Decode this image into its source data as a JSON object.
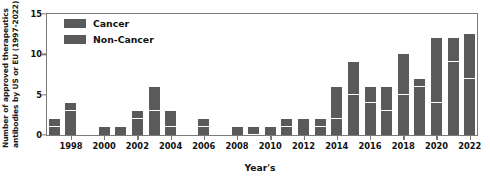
{
  "chart_data": {
    "type": "bar",
    "subtype": "stacked-bar",
    "title": "",
    "xlabel": "Year's",
    "ylabel": "Number of approved therapeutics antibodies by US or EU (1997-2022)",
    "ylabel_lines": [
      "Number of approved therapeutics",
      "antibodies by US or EU (1997-2022)"
    ],
    "ylim": [
      0,
      15
    ],
    "yticks": [
      0,
      5,
      10,
      15
    ],
    "ytick_labels": [
      "0",
      "5",
      "10",
      "15"
    ],
    "xlim": [
      1996.5,
      2022.5
    ],
    "xticks": [
      1998,
      2000,
      2002,
      2004,
      2006,
      2008,
      2010,
      2012,
      2014,
      2016,
      2018,
      2020,
      2022
    ],
    "xtick_labels": [
      "1998",
      "2000",
      "2002",
      "2004",
      "2006",
      "2008",
      "2010",
      "2012",
      "2014",
      "2016",
      "2018",
      "2020",
      "2022"
    ],
    "grid": false,
    "legend_position": "upper-left",
    "categories": [
      "1997",
      "1998",
      "1999",
      "2000",
      "2001",
      "2002",
      "2003",
      "2004",
      "2005",
      "2006",
      "2007",
      "2008",
      "2009",
      "2010",
      "2011",
      "2012",
      "2013",
      "2014",
      "2015",
      "2016",
      "2017",
      "2018",
      "2019",
      "2020",
      "2021",
      "2022"
    ],
    "series": [
      {
        "name": "Non-Cancer",
        "color": "#5a5a5a",
        "values": [
          1,
          3,
          0,
          1,
          1,
          2,
          3,
          1,
          0,
          1,
          0,
          1,
          0,
          1,
          1,
          2,
          1,
          2,
          5,
          4,
          3,
          5,
          6,
          4,
          9,
          7
        ]
      },
      {
        "name": "Cancer",
        "color": "#5a5a5a",
        "values": [
          1,
          1,
          0,
          0,
          0,
          1,
          3,
          2,
          0,
          1,
          0,
          0,
          1,
          0,
          1,
          0,
          1,
          4,
          4,
          2,
          3,
          5,
          1,
          8,
          3,
          5.5
        ]
      }
    ],
    "totals": [
      2,
      4,
      0,
      1,
      1,
      3,
      6,
      3,
      0,
      2,
      0,
      1,
      1,
      1,
      2,
      2,
      2,
      6,
      9,
      6,
      6,
      10,
      7,
      12,
      12,
      12.5
    ],
    "bar_color": "#5a5a5a",
    "frame_color": "#7a7a7a",
    "background": "#ffffff"
  },
  "legend": {
    "items": [
      {
        "label": "Cancer",
        "color": "#5a5a5a"
      },
      {
        "label": "Non-Cancer",
        "color": "#5a5a5a"
      }
    ]
  }
}
